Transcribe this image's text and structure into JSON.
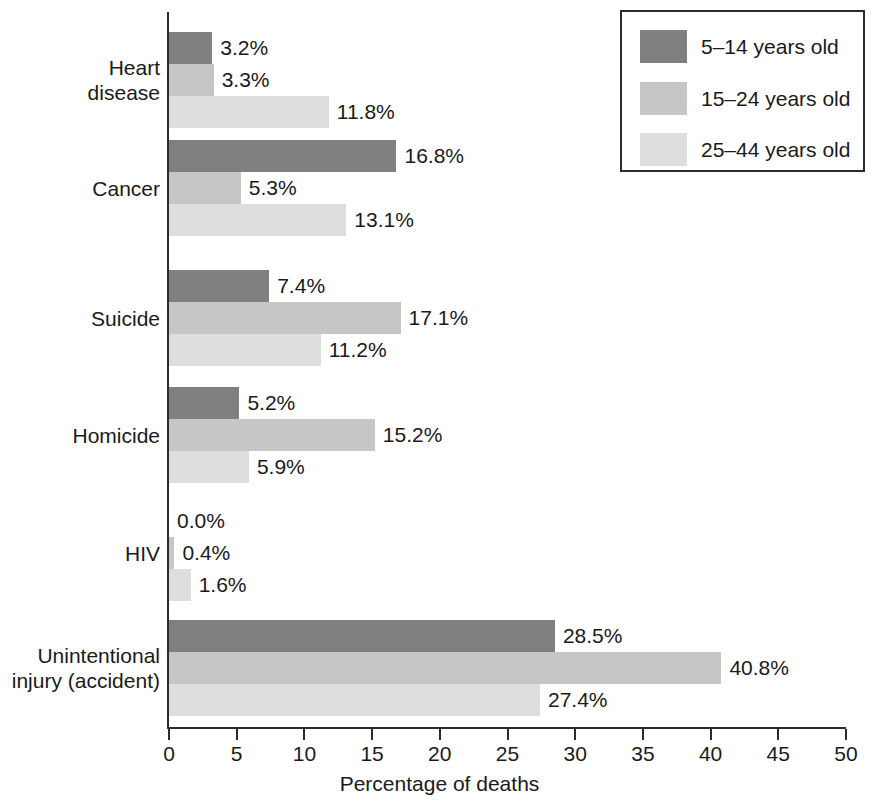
{
  "chart_data": {
    "type": "bar",
    "orientation": "horizontal",
    "title": "",
    "xlabel": "Percentage of deaths",
    "ylabel": "",
    "xlim": [
      0,
      50
    ],
    "xticks": [
      0,
      5,
      10,
      15,
      20,
      25,
      30,
      35,
      40,
      45,
      50
    ],
    "xtick_labels": [
      "0",
      "5",
      "10",
      "15",
      "20",
      "25",
      "30",
      "35",
      "40",
      "45",
      "50"
    ],
    "grid": false,
    "legend_position": "top-right",
    "value_label_suffix": "%",
    "categories": [
      "Heart\ndisease",
      "Cancer",
      "Suicide",
      "Homicide",
      "HIV",
      "Unintentional\ninjury (accident)"
    ],
    "series": [
      {
        "name": "5–14 years old",
        "color": "#80807f",
        "values": [
          3.2,
          16.8,
          7.4,
          5.2,
          0.0,
          28.5
        ],
        "labels": [
          "3.2%",
          "16.8%",
          "7.4%",
          "5.2%",
          "0.0%",
          "28.5%"
        ]
      },
      {
        "name": "15–24 years old",
        "color": "#c6c6c6",
        "values": [
          3.3,
          5.3,
          17.1,
          15.2,
          0.4,
          40.8
        ],
        "labels": [
          "3.3%",
          "5.3%",
          "17.1%",
          "15.2%",
          "0.4%",
          "40.8%"
        ]
      },
      {
        "name": "25–44 years old",
        "color": "#dedede",
        "values": [
          11.8,
          13.1,
          11.2,
          5.9,
          1.6,
          27.4
        ],
        "labels": [
          "11.8%",
          "13.1%",
          "11.2%",
          "5.9%",
          "1.6%",
          "27.4%"
        ]
      }
    ]
  },
  "legend": {
    "entries": [
      {
        "label": "5–14 years old"
      },
      {
        "label": "15–24 years old"
      },
      {
        "label": "25–44 years old"
      }
    ]
  },
  "axis": {
    "x_title": "Percentage of deaths"
  }
}
